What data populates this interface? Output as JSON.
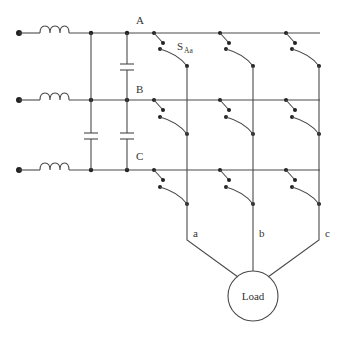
{
  "diagram": {
    "title": "",
    "type": "matrix converter circuit",
    "input_nodes": [
      {
        "label": "A"
      },
      {
        "label": "B"
      },
      {
        "label": "C"
      }
    ],
    "output_nodes": [
      {
        "label": "a"
      },
      {
        "label": "b"
      },
      {
        "label": "c"
      }
    ],
    "switch_label": {
      "main": "S",
      "subscript": "Aa"
    },
    "load_label": "Load",
    "components": {
      "inductors": 3,
      "capacitors": 3,
      "switches": 9
    },
    "colors": {
      "line": "#4a4a4a",
      "dot": "#222222",
      "background": "#ffffff"
    }
  }
}
